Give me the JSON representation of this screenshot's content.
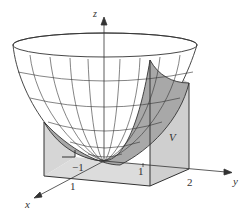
{
  "figure": {
    "axes": {
      "x_label": "x",
      "y_label": "y",
      "z_label": "z"
    },
    "tick_labels": {
      "x_1": "1",
      "neg_1": "−1",
      "y_1": "1",
      "y_2": "2"
    },
    "region_label": "V",
    "colors": {
      "line": "#333333",
      "box_fill": "#d4d4d4",
      "surface_fill": "#a6a6a6",
      "paraboloid_fill": "#ffffff"
    }
  }
}
